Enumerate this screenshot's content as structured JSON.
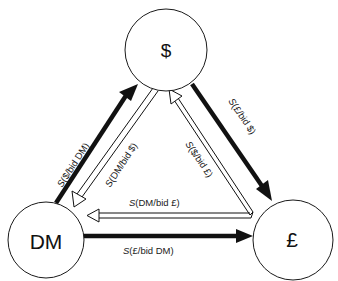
{
  "diagram": {
    "nodes": [
      {
        "id": "usd",
        "label": "$",
        "cx": 166,
        "cy": 50,
        "r": 41
      },
      {
        "id": "dm",
        "label": "DM",
        "cx": 46,
        "cy": 240,
        "r": 38
      },
      {
        "id": "gbp",
        "label": "£",
        "cx": 293,
        "cy": 240,
        "r": 40
      }
    ],
    "edges": [
      {
        "from": "DM",
        "to": "$",
        "style": "solid-thick",
        "label_prefix": "S",
        "label_body": "($/bid DM)"
      },
      {
        "from": "$",
        "to": "DM",
        "style": "hollow",
        "label_prefix": "S",
        "label_body": "(DM/bid $)"
      },
      {
        "from": "$",
        "to": "£",
        "style": "solid-thick",
        "label_prefix": "S",
        "label_body": "(£/bid $)"
      },
      {
        "from": "£",
        "to": "$",
        "style": "hollow",
        "label_prefix": "S",
        "label_body": "($/bid £)"
      },
      {
        "from": "£",
        "to": "DM",
        "style": "hollow",
        "label_prefix": "S",
        "label_body": "(DM/bid £)"
      },
      {
        "from": "DM",
        "to": "£",
        "style": "solid-thick",
        "label_prefix": "S",
        "label_body": "(£/bid DM)"
      }
    ],
    "colors": {
      "stroke": "#1a1a1a",
      "background": "#ffffff"
    }
  }
}
